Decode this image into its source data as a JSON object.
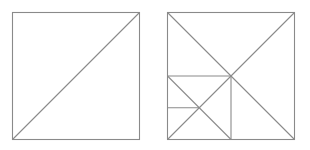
{
  "diagram": {
    "stroke_color": "#8a8a8a",
    "background": "#ffffff",
    "figures": [
      {
        "name": "left-square",
        "square": {
          "x1": 12.5,
          "y1": 12.5,
          "x2": 139.5,
          "y2": 139.5
        },
        "lines": [
          {
            "name": "diagonal-bottom-left-to-top-right",
            "x1": 12.5,
            "y1": 139.5,
            "x2": 139.5,
            "y2": 12.5
          }
        ]
      },
      {
        "name": "right-square",
        "square": {
          "x1": 167.5,
          "y1": 12.5,
          "x2": 294.5,
          "y2": 139.5
        },
        "lines": [
          {
            "name": "diagonal-top-left-to-bottom-right",
            "x1": 167.5,
            "y1": 12.5,
            "x2": 294.5,
            "y2": 139.5
          },
          {
            "name": "diagonal-bottom-left-to-top-right",
            "x1": 167.5,
            "y1": 139.5,
            "x2": 294.5,
            "y2": 12.5
          },
          {
            "name": "inner-square-top-edge",
            "x1": 167.5,
            "y1": 76,
            "x2": 231,
            "y2": 76
          },
          {
            "name": "inner-square-right-edge",
            "x1": 231,
            "y1": 76,
            "x2": 231,
            "y2": 139.5
          },
          {
            "name": "inner-square-diagonal",
            "x1": 167.5,
            "y1": 76,
            "x2": 231,
            "y2": 139.5
          },
          {
            "name": "small-horizontal-segment",
            "x1": 167.5,
            "y1": 107.75,
            "x2": 199.25,
            "y2": 107.75
          }
        ]
      }
    ]
  }
}
